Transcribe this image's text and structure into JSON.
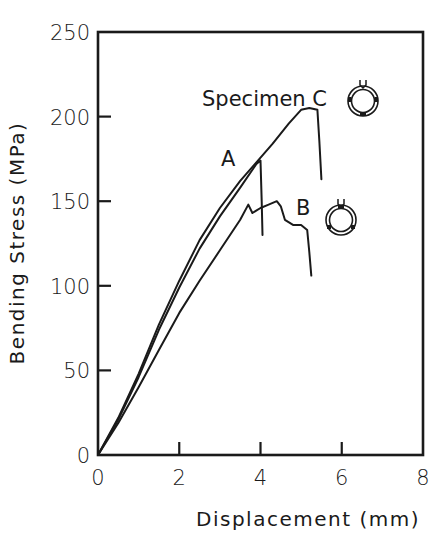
{
  "chart_data": {
    "type": "line",
    "title": "",
    "xlabel": "Displacement (mm)",
    "ylabel": "Bending Stress (MPa)",
    "xlim": [
      0,
      8
    ],
    "ylim": [
      0,
      250
    ],
    "x_ticks": [
      0,
      2,
      4,
      6,
      8
    ],
    "y_ticks": [
      0,
      50,
      100,
      150,
      200,
      250
    ],
    "grid": false,
    "legend": "none (inline curve labels)",
    "series": [
      {
        "name": "Specimen C",
        "label": "Specimen C",
        "points": [
          [
            0,
            0
          ],
          [
            0.5,
            22
          ],
          [
            1.0,
            48
          ],
          [
            1.5,
            77
          ],
          [
            2.0,
            103
          ],
          [
            2.5,
            127
          ],
          [
            3.0,
            146
          ],
          [
            3.5,
            162
          ],
          [
            3.9,
            173
          ],
          [
            4.3,
            184
          ],
          [
            4.7,
            196
          ],
          [
            5.0,
            204
          ],
          [
            5.2,
            205
          ],
          [
            5.4,
            204
          ],
          [
            5.45,
            185
          ],
          [
            5.5,
            163
          ]
        ]
      },
      {
        "name": "A",
        "label": "A",
        "points": [
          [
            0,
            0
          ],
          [
            0.5,
            21
          ],
          [
            1.0,
            46
          ],
          [
            1.5,
            74
          ],
          [
            2.0,
            99
          ],
          [
            2.5,
            122
          ],
          [
            3.0,
            141
          ],
          [
            3.5,
            158
          ],
          [
            3.9,
            172
          ],
          [
            4.0,
            174
          ],
          [
            4.03,
            150
          ],
          [
            4.05,
            130
          ]
        ]
      },
      {
        "name": "B",
        "label": "B",
        "points": [
          [
            0,
            0
          ],
          [
            0.5,
            19
          ],
          [
            1.0,
            40
          ],
          [
            1.5,
            62
          ],
          [
            2.0,
            84
          ],
          [
            2.5,
            103
          ],
          [
            3.0,
            121
          ],
          [
            3.5,
            139
          ],
          [
            3.7,
            148
          ],
          [
            3.8,
            143
          ],
          [
            4.0,
            146
          ],
          [
            4.2,
            148
          ],
          [
            4.4,
            150
          ],
          [
            4.5,
            147
          ],
          [
            4.6,
            139
          ],
          [
            4.8,
            136
          ],
          [
            5.0,
            136
          ],
          [
            5.15,
            133
          ],
          [
            5.2,
            120
          ],
          [
            5.25,
            106
          ]
        ]
      }
    ],
    "annotations": [
      {
        "text": "Specimen C",
        "x": 2.6,
        "y": 212
      },
      {
        "text": "A",
        "x": 3.15,
        "y": 178
      },
      {
        "text": "B",
        "x": 5.0,
        "y": 145
      },
      {
        "type": "ring-icon",
        "for": "Specimen C",
        "note": "ring loaded from top (arrow), contact marks at left, right, bottom"
      },
      {
        "type": "ring-icon",
        "for": "B",
        "note": "ring loaded from top (arrow), marks at top, lower-left, lower-right"
      }
    ]
  },
  "axes": {
    "x_title": "Displacement (mm)",
    "y_title": "Bending Stress (MPa)",
    "x_tick_labels": [
      "0",
      "2",
      "4",
      "6",
      "8"
    ],
    "y_tick_labels": [
      "0",
      "50",
      "100",
      "150",
      "200",
      "250"
    ]
  },
  "labels": {
    "specimen_c": "Specimen C",
    "a": "A",
    "b": "B"
  }
}
